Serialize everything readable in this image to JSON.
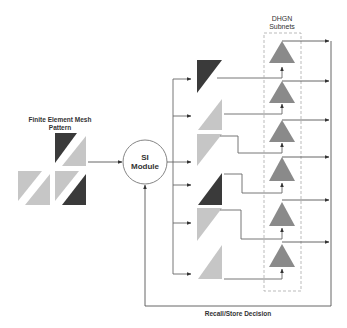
{
  "labels": {
    "input_title_line1": "Finite Element Mesh",
    "input_title_line2": "Pattern",
    "module_line1": "SI",
    "module_line2": "Module",
    "subnets_line1": "DHGN",
    "subnets_line2": "Subnets",
    "feedback": "Recall/Store Decision"
  },
  "colors": {
    "dark": "#3a3a3a",
    "light": "#c6c6c6",
    "node": "#8a8a8a",
    "line": "#555555",
    "dashed": "#aaaaaa"
  },
  "input_pattern": {
    "cells": [
      {
        "row": 0,
        "col": 1,
        "upper_left": "dark",
        "lower_right": "light"
      },
      {
        "row": 1,
        "col": 0,
        "upper_left": "light",
        "lower_right": "light"
      },
      {
        "row": 1,
        "col": 1,
        "upper_left": "light",
        "lower_right": "dark"
      }
    ]
  },
  "sub_patterns": [
    {
      "id": 1,
      "shade": "dark",
      "orientation": "upper-left"
    },
    {
      "id": 2,
      "shade": "light",
      "orientation": "lower-right"
    },
    {
      "id": 3,
      "shade": "light",
      "orientation": "upper-left"
    },
    {
      "id": 4,
      "shade": "dark",
      "orientation": "lower-right"
    },
    {
      "id": 5,
      "shade": "light",
      "orientation": "upper-left"
    },
    {
      "id": 6,
      "shade": "light",
      "orientation": "lower-right"
    }
  ],
  "subnets": {
    "count": 6
  }
}
